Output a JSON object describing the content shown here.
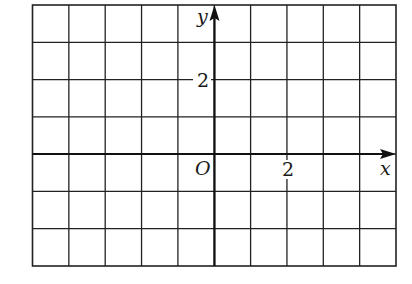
{
  "diagram": {
    "type": "coordinate-grid",
    "grid": {
      "columns": 10,
      "rows": 7,
      "x_range": [
        -5,
        5
      ],
      "y_range": [
        -3,
        4
      ],
      "line_color": "#222222",
      "background": "#ffffff"
    },
    "axes": {
      "x_label": "x",
      "y_label": "y",
      "origin_label": "O",
      "x_tick_label": "2",
      "y_tick_label": "2",
      "x_tick_value": 2,
      "y_tick_value": 2,
      "color": "#111111"
    }
  }
}
